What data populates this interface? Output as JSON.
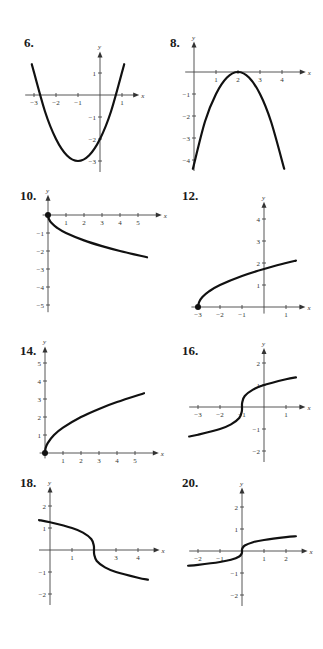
{
  "chart_data": [
    {
      "id": "g6",
      "label": "6.",
      "type": "line",
      "origin": [
        100,
        95
      ],
      "ux": 22,
      "uy": 22,
      "xticks": [
        -3,
        -2,
        -1,
        1
      ],
      "yticks": [
        1,
        -1,
        -2,
        -3
      ],
      "xrange": [
        -3.4,
        1.6
      ],
      "yrange": [
        -3.5,
        1.8
      ],
      "description": "Upward parabola with vertex at (-1,-3), y-intercept -2",
      "xlabel": "x",
      "ylabel": "y",
      "points": [
        [
          -3.1,
          1.4
        ],
        [
          -2.5,
          -0.75
        ],
        [
          -2,
          -2
        ],
        [
          -1.5,
          -2.75
        ],
        [
          -1,
          -3
        ],
        [
          -0.5,
          -2.75
        ],
        [
          0,
          -2
        ],
        [
          0.5,
          -0.75
        ],
        [
          1.1,
          1.4
        ]
      ]
    },
    {
      "id": "g8",
      "label": "8.",
      "type": "line",
      "origin": [
        194,
        72
      ],
      "ux": 22,
      "uy": 22,
      "xticks": [
        1,
        2,
        3,
        4
      ],
      "yticks": [
        -1,
        -2,
        -3,
        -4
      ],
      "xrange": [
        -0.4,
        4.9
      ],
      "yrange": [
        -4.5,
        1.2
      ],
      "description": "Downward parabola with vertex at (2,0)",
      "xlabel": "x",
      "ylabel": "y",
      "points": [
        [
          -0.05,
          -4.4
        ],
        [
          0.5,
          -2.25
        ],
        [
          1,
          -1
        ],
        [
          1.5,
          -0.25
        ],
        [
          2,
          0
        ],
        [
          2.5,
          -0.25
        ],
        [
          3,
          -1
        ],
        [
          3.5,
          -2.25
        ],
        [
          4.1,
          -4.4
        ]
      ]
    },
    {
      "id": "g10",
      "label": "10.",
      "type": "line",
      "origin": [
        48,
        215
      ],
      "ux": 18,
      "uy": 18,
      "xticks": [
        1,
        2,
        3,
        4,
        5
      ],
      "yticks": [
        -1,
        -2,
        -3,
        -4,
        -5
      ],
      "xrange": [
        -0.3,
        6.1
      ],
      "yrange": [
        -5.4,
        0.9
      ],
      "description": "y = -sqrt(x), starting at (0,0) closed dot",
      "xlabel": "x",
      "ylabel": "y",
      "start_dot": [
        0,
        0
      ],
      "points": [
        [
          0,
          0
        ],
        [
          0.05,
          -0.22
        ],
        [
          0.2,
          -0.45
        ],
        [
          0.5,
          -0.71
        ],
        [
          1,
          -1
        ],
        [
          2,
          -1.41
        ],
        [
          3,
          -1.73
        ],
        [
          4,
          -2
        ],
        [
          5.5,
          -2.35
        ]
      ]
    },
    {
      "id": "g12",
      "label": "12.",
      "type": "line",
      "origin": [
        264,
        307
      ],
      "ux": 22,
      "uy": 22,
      "xticks": [
        -3,
        -2,
        -1,
        1
      ],
      "yticks": [
        1,
        2,
        3,
        4
      ],
      "xrange": [
        -3.3,
        1.7
      ],
      "yrange": [
        -0.3,
        4.6
      ],
      "description": "y = sqrt(x+3), starting at (-3,0) closed dot",
      "xlabel": "x",
      "ylabel": "y",
      "start_dot": [
        -3,
        0
      ],
      "points": [
        [
          -3,
          0
        ],
        [
          -2.95,
          0.22
        ],
        [
          -2.8,
          0.45
        ],
        [
          -2.5,
          0.71
        ],
        [
          -2,
          1
        ],
        [
          -1,
          1.41
        ],
        [
          0,
          1.73
        ],
        [
          1,
          2
        ],
        [
          1.45,
          2.11
        ]
      ]
    },
    {
      "id": "g14",
      "label": "14.",
      "type": "line",
      "origin": [
        45,
        453
      ],
      "ux": 18,
      "uy": 18,
      "xticks": [
        1,
        2,
        3,
        4,
        5
      ],
      "yticks": [
        1,
        2,
        3,
        4,
        5
      ],
      "xrange": [
        -0.3,
        6.1
      ],
      "yrange": [
        -0.3,
        5.7
      ],
      "description": "y = sqrt(2x), starting at (0,0) closed dot",
      "xlabel": "x",
      "ylabel": "y",
      "start_dot": [
        0,
        0
      ],
      "points": [
        [
          0,
          0
        ],
        [
          0.03,
          0.25
        ],
        [
          0.15,
          0.55
        ],
        [
          0.5,
          1
        ],
        [
          1,
          1.41
        ],
        [
          2,
          2
        ],
        [
          3,
          2.45
        ],
        [
          4,
          2.83
        ],
        [
          5.5,
          3.32
        ]
      ]
    },
    {
      "id": "g16",
      "label": "16.",
      "type": "line",
      "origin": [
        264,
        407
      ],
      "ux": 22,
      "uy": 22,
      "xticks": [
        -3,
        -2,
        -1,
        1
      ],
      "yticks": [
        2,
        1,
        -1,
        -2
      ],
      "xrange": [
        -3.4,
        1.7
      ],
      "yrange": [
        -2.5,
        2.5
      ],
      "description": "Cube-root curve y = cbrt(x+1), inflection at (-1,0)",
      "xlabel": "x",
      "ylabel": "y",
      "points": [
        [
          -3.4,
          -1.34
        ],
        [
          -3,
          -1.26
        ],
        [
          -2,
          -1
        ],
        [
          -1.5,
          -0.79
        ],
        [
          -1.125,
          -0.5
        ],
        [
          -1.01,
          -0.2
        ],
        [
          -1,
          0
        ],
        [
          -0.99,
          0.2
        ],
        [
          -0.875,
          0.5
        ],
        [
          -0.5,
          0.79
        ],
        [
          0,
          1
        ],
        [
          1,
          1.26
        ],
        [
          1.45,
          1.35
        ]
      ]
    },
    {
      "id": "g18",
      "label": "18.",
      "type": "line",
      "origin": [
        50,
        550
      ],
      "ux": 22,
      "uy": 22,
      "xticks": [
        1,
        3,
        4
      ],
      "yticks": [
        2,
        1,
        -1,
        -2
      ],
      "xrange": [
        -0.5,
        4.8
      ],
      "yrange": [
        -2.5,
        2.7
      ],
      "description": "Decreasing cube-root curve y = -cbrt(x-2), inflection at (2,0)",
      "xlabel": "x",
      "ylabel": "y",
      "points": [
        [
          -0.5,
          1.36
        ],
        [
          0,
          1.26
        ],
        [
          1,
          1
        ],
        [
          1.5,
          0.79
        ],
        [
          1.875,
          0.5
        ],
        [
          1.99,
          0.2
        ],
        [
          2,
          0
        ],
        [
          2.01,
          -0.2
        ],
        [
          2.125,
          -0.5
        ],
        [
          2.5,
          -0.79
        ],
        [
          3,
          -1
        ],
        [
          4,
          -1.26
        ],
        [
          4.45,
          -1.35
        ]
      ]
    },
    {
      "id": "g20",
      "label": "20.",
      "type": "line",
      "origin": [
        242,
        551
      ],
      "ux": 22,
      "uy": 22,
      "xticks": [
        -2,
        -1,
        1,
        2
      ],
      "yticks": [
        2,
        1,
        -1,
        -2
      ],
      "xrange": [
        -2.4,
        2.8
      ],
      "yrange": [
        -2.5,
        2.7
      ],
      "description": "Flattened cube-root curve y = 0.5*cbrt(x), inflection at origin",
      "xlabel": "x",
      "ylabel": "y",
      "points": [
        [
          -2.45,
          -0.67
        ],
        [
          -2,
          -0.63
        ],
        [
          -1,
          -0.5
        ],
        [
          -0.5,
          -0.4
        ],
        [
          -0.125,
          -0.25
        ],
        [
          -0.01,
          -0.1
        ],
        [
          0,
          0
        ],
        [
          0.01,
          0.1
        ],
        [
          0.125,
          0.25
        ],
        [
          0.5,
          0.4
        ],
        [
          1,
          0.5
        ],
        [
          2,
          0.63
        ],
        [
          2.45,
          0.67
        ]
      ]
    }
  ],
  "labels": {
    "g6": "6.",
    "g8": "8.",
    "g10": "10.",
    "g12": "12.",
    "g14": "14.",
    "g16": "16.",
    "g18": "18.",
    "g20": "20."
  }
}
